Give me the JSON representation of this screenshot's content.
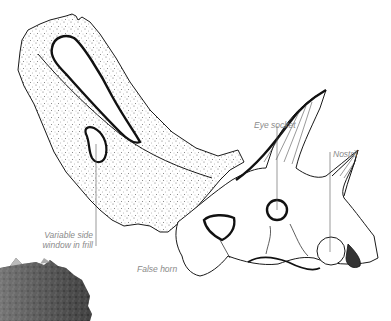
{
  "figure": {
    "labels": {
      "eye_socket": "Eye socket",
      "nostril": "Nostril",
      "side_window": "Variable side window in frill",
      "side_window_line1": "Variable side",
      "side_window_line2": "window in frill",
      "false_horn": "False horn"
    },
    "colors": {
      "line": "#1a1a1a",
      "label": "#8a8a8a",
      "stipple": "#555555",
      "fossil_dark": "#4a4a4a",
      "fossil_light": "#9a9a9a",
      "background": "#ffffff"
    },
    "inset": {
      "description": "photo fragment of fossil frill edge",
      "position": "bottom-left"
    }
  }
}
